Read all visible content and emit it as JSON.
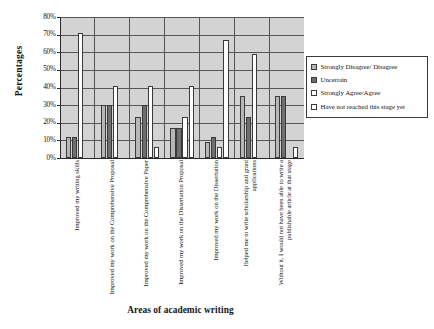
{
  "chart_data": {
    "type": "bar",
    "title": "",
    "xlabel": "Areas of academic writing",
    "ylabel": "Percentages",
    "ylim": [
      0,
      80
    ],
    "ytick_labels": [
      "80%",
      "70%",
      "60%",
      "50%",
      "40%",
      "30%",
      "20%",
      "10%",
      "0%"
    ],
    "ytick_values": [
      80,
      70,
      60,
      50,
      40,
      30,
      20,
      10,
      0
    ],
    "grid": true,
    "legend_position": "right",
    "categories": [
      "Improved my writing skills",
      "Improved my work on the Comprehensive Proposal",
      "Improved my work on the Comprehensive Paper",
      "Improved my work on the Dissertation Proposal",
      "Improved my work on the Dissertation",
      "Helped me to write scholarship and grant applications",
      "Without it, I would not have been able to write a publishable article at that stage"
    ],
    "series": [
      {
        "name": "Strongly Disagree/ Disagree",
        "color": "#b6b6b6",
        "values": [
          12,
          30,
          23,
          17,
          9,
          35,
          35
        ]
      },
      {
        "name": "Uncertain",
        "color": "#6f6f6f",
        "values": [
          12,
          30,
          30,
          17,
          12,
          23,
          35
        ]
      },
      {
        "name": "Strongly Agree/Agree",
        "color": "#ffffff",
        "values": [
          71,
          41,
          41,
          23,
          6,
          59,
          0
        ]
      },
      {
        "name": "Have not reached this stage yet",
        "color": "#ffffff",
        "values": [
          0,
          0,
          6,
          41,
          67,
          0,
          6
        ]
      }
    ]
  }
}
